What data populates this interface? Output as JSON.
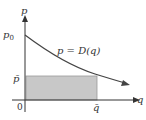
{
  "diagram": {
    "axes": {
      "y_label": "p",
      "x_label": "q",
      "origin_label": "0",
      "y_intercept_label": "p",
      "y_intercept_subscript": "0"
    },
    "curve": {
      "label": "p = D(q)",
      "color": "#444444"
    },
    "rectangle": {
      "price_label": "p̄",
      "quantity_label": "q̄",
      "fill_color": "#c8c8c8",
      "stroke_color": "#9a9a9a"
    },
    "colors": {
      "axis": "#333333",
      "text": "#333333"
    }
  }
}
